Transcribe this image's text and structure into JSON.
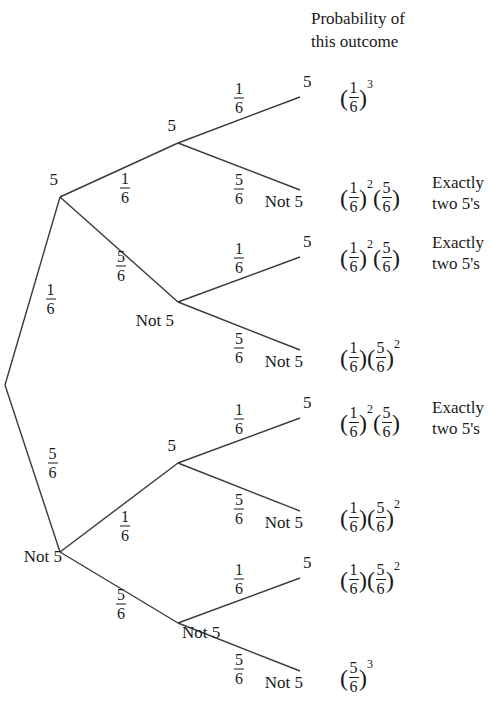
{
  "header": {
    "line1": "Probability of",
    "line2": "this outcome"
  },
  "labels": {
    "five": "5",
    "not_five": "Not 5"
  },
  "fractions": {
    "one_sixth": {
      "num": "1",
      "den": "6"
    },
    "five_sixths": {
      "num": "5",
      "den": "6"
    }
  },
  "tree": {
    "root": {
      "x": 5,
      "y": 385
    },
    "level1": [
      {
        "id": "branch-5",
        "label": "5",
        "prob_num": "1",
        "prob_den": "6",
        "node_x": 60,
        "node_y": 197
      },
      {
        "id": "branch-not5",
        "label": "Not 5",
        "prob_num": "5",
        "prob_den": "6",
        "node_x": 60,
        "node_y": 552
      }
    ],
    "level2": [
      {
        "id": "branch-5-5",
        "label": "5",
        "prob_num": "1",
        "prob_den": "6",
        "node_x": 178,
        "node_y": 143
      },
      {
        "id": "branch-5-not5",
        "label": "Not 5",
        "prob_num": "5",
        "prob_den": "6",
        "node_x": 178,
        "node_y": 302
      },
      {
        "id": "branch-not5-5",
        "label": "5",
        "prob_num": "1",
        "prob_den": "6",
        "node_x": 178,
        "node_y": 463
      },
      {
        "id": "branch-not5-not5",
        "label": "Not 5",
        "prob_num": "5",
        "prob_den": "6",
        "node_x": 178,
        "node_y": 623
      }
    ],
    "leaves": [
      {
        "id": "leaf-1",
        "label": "5",
        "prob_num": "1",
        "prob_den": "6",
        "x": 300,
        "y": 97
      },
      {
        "id": "leaf-2",
        "label": "Not 5",
        "prob_num": "5",
        "prob_den": "6",
        "x": 300,
        "y": 190
      },
      {
        "id": "leaf-3",
        "label": "5",
        "prob_num": "1",
        "prob_den": "6",
        "x": 300,
        "y": 257
      },
      {
        "id": "leaf-4",
        "label": "Not 5",
        "prob_num": "5",
        "prob_den": "6",
        "x": 300,
        "y": 350
      },
      {
        "id": "leaf-5",
        "label": "5",
        "prob_num": "1",
        "prob_den": "6",
        "x": 300,
        "y": 418
      },
      {
        "id": "leaf-6",
        "label": "Not 5",
        "prob_num": "5",
        "prob_den": "6",
        "x": 300,
        "y": 511
      },
      {
        "id": "leaf-7",
        "label": "5",
        "prob_num": "1",
        "prob_den": "6",
        "x": 300,
        "y": 578
      },
      {
        "id": "leaf-8",
        "label": "Not 5",
        "prob_num": "5",
        "prob_den": "6",
        "x": 300,
        "y": 671
      }
    ]
  },
  "outcomes": [
    {
      "id": "outcome-1",
      "y": 80,
      "groups": [
        {
          "num": "1",
          "den": "6",
          "exp": "3"
        }
      ],
      "note": null
    },
    {
      "id": "outcome-2",
      "y": 180,
      "groups": [
        {
          "num": "1",
          "den": "6",
          "exp": "2"
        },
        {
          "num": "5",
          "den": "6",
          "exp": ""
        }
      ],
      "note": {
        "line1": "Exactly",
        "line2": "two 5's"
      }
    },
    {
      "id": "outcome-3",
      "y": 240,
      "groups": [
        {
          "num": "1",
          "den": "6",
          "exp": "2"
        },
        {
          "num": "5",
          "den": "6",
          "exp": ""
        }
      ],
      "note": {
        "line1": "Exactly",
        "line2": "two 5's"
      }
    },
    {
      "id": "outcome-4",
      "y": 340,
      "groups": [
        {
          "num": "1",
          "den": "6",
          "exp": ""
        },
        {
          "num": "5",
          "den": "6",
          "exp": "2"
        }
      ],
      "note": null
    },
    {
      "id": "outcome-5",
      "y": 405,
      "groups": [
        {
          "num": "1",
          "den": "6",
          "exp": "2"
        },
        {
          "num": "5",
          "den": "6",
          "exp": ""
        }
      ],
      "note": {
        "line1": "Exactly",
        "line2": "two 5's"
      }
    },
    {
      "id": "outcome-6",
      "y": 500,
      "groups": [
        {
          "num": "1",
          "den": "6",
          "exp": ""
        },
        {
          "num": "5",
          "den": "6",
          "exp": "2"
        }
      ],
      "note": null
    },
    {
      "id": "outcome-7",
      "y": 562,
      "groups": [
        {
          "num": "1",
          "den": "6",
          "exp": ""
        },
        {
          "num": "5",
          "den": "6",
          "exp": "2"
        }
      ],
      "note": null
    },
    {
      "id": "outcome-8",
      "y": 660,
      "groups": [
        {
          "num": "5",
          "den": "6",
          "exp": "3"
        }
      ],
      "note": null
    }
  ],
  "style": {
    "line_color": "#3a3a3a",
    "text_color": "#1a1a1a"
  }
}
